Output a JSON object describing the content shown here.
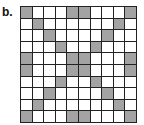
{
  "panel": {
    "label": "b."
  },
  "grid": {
    "rows": 10,
    "cols": 10,
    "colors": {
      "shaded": "#a3a3a3",
      "empty": "#ffffff",
      "line": "#222222"
    },
    "shaded_cells": [
      [
        0,
        4,
        5,
        9
      ],
      [
        1,
        8
      ],
      [
        2,
        7
      ],
      [
        3,
        6
      ],
      [
        0,
        4,
        5,
        9
      ],
      [
        0,
        4,
        5,
        9
      ],
      [
        3,
        6
      ],
      [
        2,
        7
      ],
      [
        1,
        8
      ],
      [
        0,
        4,
        5,
        9
      ]
    ]
  }
}
